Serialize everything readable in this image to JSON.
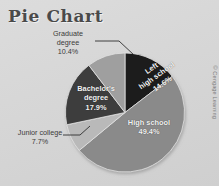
{
  "figure": {
    "title": "Pie Chart",
    "background_color": "#d7d7d7",
    "credit": "© Cengage Learning"
  },
  "chart_data": {
    "type": "pie",
    "title": "Pie Chart",
    "xlabel": "",
    "ylabel": "",
    "grid": false,
    "legend_position": "none",
    "label_style": "slice-labels-with-leader-lines",
    "start_angle_deg": 90,
    "direction": "clockwise",
    "categories": [
      "Left high school",
      "High school",
      "Junior college",
      "Bachelor's degree",
      "Graduate degree"
    ],
    "values": [
      14.6,
      49.4,
      7.7,
      17.9,
      10.4
    ],
    "value_unit": "percent",
    "colors": [
      "#1c1c1c",
      "#8a8a8a",
      "#b9b9b9",
      "#3e3e3e",
      "#9f9f9f"
    ],
    "slices": [
      {
        "label": "Left high school",
        "value": 14.6,
        "value_text": "14.6%",
        "color": "#1c1c1c",
        "label_placement": "inside",
        "label_rotated": true
      },
      {
        "label": "High school",
        "value": 49.4,
        "value_text": "49.4%",
        "color": "#8a8a8a",
        "label_placement": "inside",
        "label_rotated": false
      },
      {
        "label": "Junior college",
        "value": 7.7,
        "value_text": "7.7%",
        "color": "#b9b9b9",
        "label_placement": "outside-leader-line",
        "label_rotated": false
      },
      {
        "label": "Bachelor's degree",
        "value": 17.9,
        "value_text": "17.9%",
        "color": "#3e3e3e",
        "label_placement": "inside",
        "label_rotated": false
      },
      {
        "label": "Graduate degree",
        "value": 10.4,
        "value_text": "10.4%",
        "color": "#9f9f9f",
        "label_placement": "outside-leader-line",
        "label_rotated": false
      }
    ]
  },
  "labels": {
    "graduate": {
      "line1": "Graduate",
      "line2": "degree",
      "line3": "10.4%"
    },
    "junior": {
      "line1": "Junior college",
      "line2": "7.7%"
    },
    "high_school": {
      "line1": "High school",
      "line2": "49.4%"
    },
    "bachelors": {
      "line1": "Bachelor's",
      "line2": "degree",
      "line3": "17.9%"
    },
    "left_high_school": {
      "line1": "Left",
      "line2": "high school",
      "line3": "14.6%"
    }
  }
}
